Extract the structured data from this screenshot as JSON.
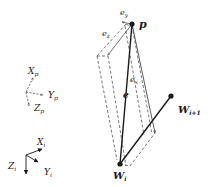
{
  "diagram": {
    "points": {
      "p": {
        "label": "p",
        "x": 132,
        "y": 24
      },
      "w_i": {
        "label": "W",
        "sub": "i",
        "x": 120,
        "y": 164
      },
      "w_i1": {
        "label": "W",
        "sub": "i+1",
        "x": 171,
        "y": 96
      }
    },
    "vectors": {
      "e": {
        "label": "e"
      },
      "e_x": {
        "label": "e",
        "sub": "x"
      },
      "e_y": {
        "label": "e",
        "sub": "y"
      },
      "e_z": {
        "label": "e",
        "sub": "z"
      }
    },
    "frame_p": {
      "x": {
        "label": "X",
        "sub": "p"
      },
      "y": {
        "label": "Y",
        "sub": "p"
      },
      "z": {
        "label": "Z",
        "sub": "p"
      }
    },
    "frame_i": {
      "x": {
        "label": "X",
        "sub": "i"
      },
      "y": {
        "label": "Y",
        "sub": "i"
      },
      "z": {
        "label": "Z",
        "sub": "i"
      }
    },
    "colors": {
      "ink": "#1a1a1a",
      "dashed": "#555555",
      "background": "#ffffff"
    }
  }
}
